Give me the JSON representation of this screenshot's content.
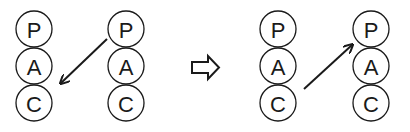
{
  "diagram": {
    "type": "before-after transformation",
    "panels": [
      {
        "id": "before",
        "stacks": [
          {
            "id": "stack-1",
            "nodes": [
              "P",
              "A",
              "C"
            ]
          },
          {
            "id": "stack-2",
            "nodes": [
              "P",
              "A",
              "C"
            ]
          }
        ],
        "edge": {
          "from": "stack-2.P",
          "to": "stack-1.C",
          "direction": "down-left"
        }
      },
      {
        "id": "after",
        "stacks": [
          {
            "id": "stack-3",
            "nodes": [
              "P",
              "A",
              "C"
            ]
          },
          {
            "id": "stack-4",
            "nodes": [
              "P",
              "A",
              "C"
            ]
          }
        ],
        "edge": {
          "from": "stack-3.C",
          "to": "stack-4.P",
          "direction": "up-right"
        }
      }
    ],
    "transition_icon": "hollow-right-arrow-icon"
  },
  "colors": {
    "stroke": "#1a1a1a",
    "background": "#ffffff"
  }
}
